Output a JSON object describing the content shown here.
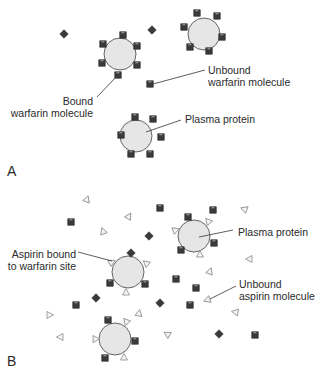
{
  "figure": {
    "panels": [
      {
        "id": "A",
        "letter": "A",
        "labels": {
          "unbound_line1": "Unbound",
          "unbound_line2": "warfarin molecule",
          "bound_line1": "Bound",
          "bound_line2": "warfarin molecule",
          "protein": "Plasma protein"
        }
      },
      {
        "id": "B",
        "letter": "B",
        "labels": {
          "protein": "Plasma protein",
          "aspirin_bound_line1": "Aspirin bound",
          "aspirin_bound_line2": "to warfarin site",
          "unbound_line1": "Unbound",
          "unbound_line2": "aspirin molecule"
        }
      }
    ],
    "legend_semantics": {
      "warfarin_glyph": "dark-square-icon",
      "aspirin_glyph": "light-triangle-icon",
      "protein_glyph": "gray-circle-icon"
    },
    "colors": {
      "protein_fill": "#e6e6e6",
      "protein_stroke": "#555555",
      "warfarin_fill": "#3a3a3a",
      "aspirin_fill": "#f4f4f4",
      "aspirin_stroke": "#8a8a8a",
      "leader_line": "#333333",
      "text": "#2a2a2a"
    }
  }
}
